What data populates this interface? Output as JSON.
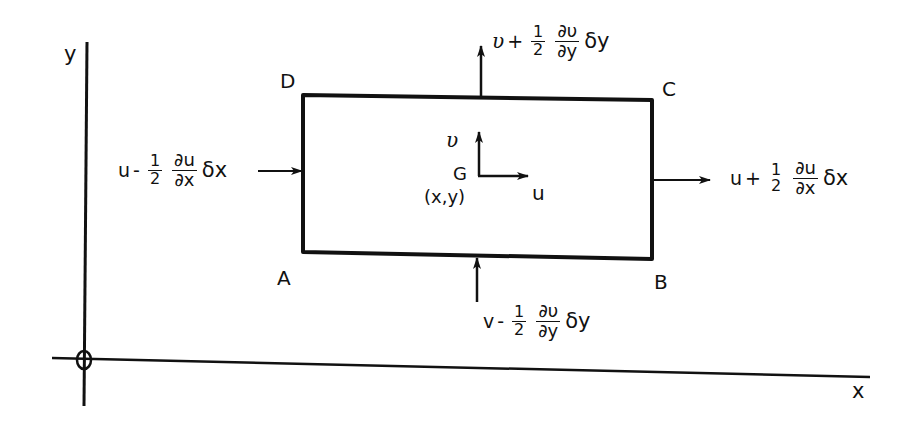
{
  "diagram": {
    "type": "control-volume-velocity-diagram",
    "axes": {
      "x_label": "x",
      "y_label": "y",
      "origin_marker": "circle-cross"
    },
    "element": {
      "corners": {
        "top_left": "D",
        "top_right": "C",
        "bottom_left": "A",
        "bottom_right": "B"
      },
      "center": {
        "label": "G",
        "coords": "(x,y)"
      },
      "center_vectors": {
        "horizontal": "u",
        "vertical": "υ"
      }
    },
    "faces": {
      "left": {
        "base": "u",
        "op": "-",
        "coef_num": "1",
        "coef_den": "2",
        "deriv_num": "∂u",
        "deriv_den": "∂x",
        "increment": "δx"
      },
      "right": {
        "base": "u",
        "op": "+",
        "coef_num": "1",
        "coef_den": "2",
        "deriv_num": "∂u",
        "deriv_den": "∂x",
        "increment": "δx"
      },
      "top": {
        "base": "υ",
        "op": "+",
        "coef_num": "1",
        "coef_den": "2",
        "deriv_num": "∂υ",
        "deriv_den": "∂y",
        "increment": "δy"
      },
      "bottom": {
        "base": "v",
        "op": "-",
        "coef_num": "1",
        "coef_den": "2",
        "deriv_num": "∂υ",
        "deriv_den": "∂y",
        "increment": "δy"
      }
    },
    "colors": {
      "ink": "#111111",
      "background": "#ffffff"
    }
  }
}
